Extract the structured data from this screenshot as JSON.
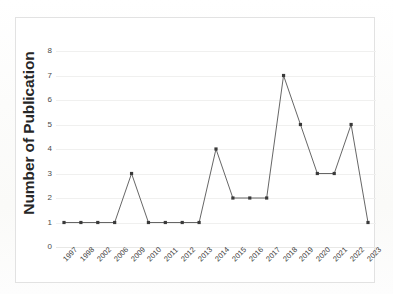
{
  "chart_data": {
    "type": "line",
    "title": "",
    "xlabel": "",
    "ylabel": "Number of Publication",
    "categories": [
      "1997",
      "1998",
      "2002",
      "2006",
      "2009",
      "2010",
      "2011",
      "2012",
      "2013",
      "2014",
      "2015",
      "2016",
      "2017",
      "2018",
      "2019",
      "2020",
      "2021",
      "2022",
      "2023"
    ],
    "values": [
      1,
      1,
      1,
      1,
      3,
      1,
      1,
      1,
      1,
      4,
      2,
      2,
      2,
      7,
      5,
      3,
      3,
      5,
      1
    ],
    "ylim": [
      0,
      8
    ],
    "yticks": [
      "0",
      "1",
      "2",
      "3",
      "4",
      "5",
      "6",
      "7",
      "8"
    ],
    "grid": true,
    "legend": "none",
    "series": [
      {
        "name": "Number of Publication",
        "values": [
          1,
          1,
          1,
          1,
          3,
          1,
          1,
          1,
          1,
          4,
          2,
          2,
          2,
          7,
          5,
          3,
          3,
          5,
          1
        ]
      }
    ],
    "marker": "square",
    "line_color": "#555555",
    "marker_color": "#3a3a3a"
  },
  "axes": {
    "y_title": "Number of Publication"
  }
}
